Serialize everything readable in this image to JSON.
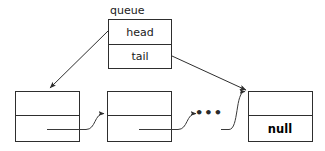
{
  "diagram": {
    "title": "queue",
    "canvas": {
      "width": 325,
      "height": 151,
      "background": "#ffffff"
    },
    "stroke_color": "#2e2e2e",
    "text_color": "#1a1a1a",
    "queue_struct": {
      "name_label": "queue",
      "fields": [
        {
          "label": "head"
        },
        {
          "label": "tail"
        }
      ]
    },
    "nodes": [
      {
        "id": "node-first",
        "value_label": "",
        "next_label": ""
      },
      {
        "id": "node-second",
        "value_label": "",
        "next_label": ""
      },
      {
        "id": "node-last",
        "value_label": "",
        "next_label": "null"
      }
    ],
    "ellipsis": "•••",
    "arrows": [
      {
        "name": "head-pointer-arrow",
        "from": "queue.head",
        "to": "node-first"
      },
      {
        "name": "tail-pointer-arrow",
        "from": "queue.tail",
        "to": "node-last"
      },
      {
        "name": "next-arrow-1",
        "from": "node-first",
        "to": "node-second"
      },
      {
        "name": "next-arrow-2",
        "from": "node-second",
        "to": "ellipsis"
      },
      {
        "name": "next-arrow-3",
        "from": "ellipsis",
        "to": "node-last"
      }
    ]
  }
}
